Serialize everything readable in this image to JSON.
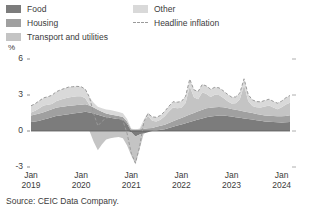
{
  "legend": {
    "left_items": [
      {
        "label": "Food",
        "color": "#7c7c7c",
        "marker": "swatch"
      },
      {
        "label": "Housing",
        "color": "#a0a0a0",
        "marker": "swatch"
      },
      {
        "label": "Transport and utilities",
        "color": "#c4c4c4",
        "marker": "swatch"
      }
    ],
    "right_items": [
      {
        "label": "Other",
        "color": "#d9d9d9",
        "marker": "swatch"
      },
      {
        "label": "Headline inflation",
        "color": "#9a9a9a",
        "marker": "dashed-line"
      }
    ]
  },
  "source": "Source: CEIC Data Company.",
  "chart_data": {
    "type": "area",
    "stacked": true,
    "title": "",
    "subtitle": "",
    "xlabel": "",
    "ylabel": "",
    "unit_label": "%",
    "grid": false,
    "legend_position": "top",
    "ylim": [
      -3,
      6
    ],
    "yticks": [
      6,
      3,
      0,
      -3
    ],
    "ytick_labels": [
      "6",
      "3",
      "0",
      "-3"
    ],
    "xlim": [
      "2019-01",
      "2024-04"
    ],
    "xticks": [
      "2019-01",
      "2020-01",
      "2021-01",
      "2022-01",
      "2023-01",
      "2024-01"
    ],
    "xtick_labels": [
      {
        "month": "Jan",
        "year": "2019"
      },
      {
        "month": "Jan",
        "year": "2020"
      },
      {
        "month": "Jan",
        "year": "2021"
      },
      {
        "month": "Jan",
        "year": "2022"
      },
      {
        "month": "Jan",
        "year": "2023"
      },
      {
        "month": "Jan",
        "year": "2024"
      }
    ],
    "x": [
      "2019-01",
      "2019-02",
      "2019-03",
      "2019-04",
      "2019-05",
      "2019-06",
      "2019-07",
      "2019-08",
      "2019-09",
      "2019-10",
      "2019-11",
      "2019-12",
      "2020-01",
      "2020-02",
      "2020-03",
      "2020-04",
      "2020-05",
      "2020-06",
      "2020-07",
      "2020-08",
      "2020-09",
      "2020-10",
      "2020-11",
      "2020-12",
      "2021-01",
      "2021-02",
      "2021-03",
      "2021-04",
      "2021-05",
      "2021-06",
      "2021-07",
      "2021-08",
      "2021-09",
      "2021-10",
      "2021-11",
      "2021-12",
      "2022-01",
      "2022-02",
      "2022-03",
      "2022-04",
      "2022-05",
      "2022-06",
      "2022-07",
      "2022-08",
      "2022-09",
      "2022-10",
      "2022-11",
      "2022-12",
      "2023-01",
      "2023-02",
      "2023-03",
      "2023-04",
      "2023-05",
      "2023-06",
      "2023-07",
      "2023-08",
      "2023-09",
      "2023-10",
      "2023-11",
      "2023-12",
      "2024-01",
      "2024-02",
      "2024-03"
    ],
    "series": [
      {
        "name": "Food",
        "color": "#7c7c7c",
        "values": [
          0.75,
          0.8,
          0.85,
          0.95,
          1.05,
          1.15,
          1.25,
          1.3,
          1.35,
          1.4,
          1.45,
          1.5,
          1.55,
          1.6,
          1.55,
          1.45,
          1.35,
          1.25,
          1.15,
          1.1,
          1.05,
          1.0,
          0.95,
          0.6,
          -0.1,
          -0.45,
          -0.3,
          -0.2,
          -0.1,
          0.0,
          0.05,
          0.1,
          0.15,
          0.25,
          0.35,
          0.45,
          0.55,
          0.65,
          0.75,
          0.85,
          0.95,
          1.05,
          1.15,
          1.2,
          1.25,
          1.3,
          1.3,
          1.25,
          1.2,
          1.15,
          1.1,
          1.05,
          1.0,
          0.95,
          0.9,
          0.85,
          0.8,
          0.78,
          0.75,
          0.72,
          0.7,
          0.72,
          0.75
        ]
      },
      {
        "name": "Housing",
        "color": "#a0a0a0",
        "values": [
          0.55,
          0.58,
          0.6,
          0.62,
          0.64,
          0.66,
          0.68,
          0.7,
          0.7,
          0.7,
          0.68,
          0.66,
          0.64,
          0.62,
          0.58,
          0.5,
          0.42,
          0.35,
          0.3,
          0.28,
          0.26,
          0.24,
          0.22,
          0.2,
          0.15,
          0.12,
          0.15,
          0.18,
          0.22,
          0.26,
          0.3,
          0.34,
          0.38,
          0.42,
          0.46,
          0.5,
          0.54,
          0.58,
          0.62,
          0.66,
          0.7,
          0.72,
          0.74,
          0.74,
          0.72,
          0.7,
          0.68,
          0.66,
          0.64,
          0.62,
          0.6,
          0.58,
          0.56,
          0.54,
          0.52,
          0.5,
          0.5,
          0.5,
          0.5,
          0.5,
          0.52,
          0.54,
          0.56
        ]
      },
      {
        "name": "Transport and utilities",
        "color": "#c4c4c4",
        "values": [
          0.25,
          0.3,
          0.45,
          0.55,
          0.5,
          0.45,
          0.55,
          0.6,
          0.65,
          0.7,
          0.72,
          0.74,
          0.7,
          0.5,
          0.05,
          -0.9,
          -1.6,
          -1.1,
          -0.7,
          -0.6,
          -0.55,
          -0.5,
          -0.6,
          -1.2,
          -1.95,
          -2.3,
          -1.2,
          0.55,
          1.05,
          0.6,
          0.45,
          0.5,
          0.7,
          0.95,
          1.15,
          0.95,
          0.85,
          1.1,
          2.35,
          1.3,
          1.0,
          1.45,
          1.2,
          0.9,
          1.05,
          1.0,
          0.8,
          0.6,
          0.45,
          0.55,
          0.95,
          2.2,
          0.95,
          0.6,
          0.55,
          0.6,
          0.75,
          0.85,
          0.7,
          0.6,
          0.75,
          0.95,
          1.05
        ]
      },
      {
        "name": "Other",
        "color": "#d9d9d9",
        "values": [
          0.55,
          0.6,
          0.62,
          0.64,
          0.66,
          0.72,
          0.78,
          0.82,
          0.84,
          0.86,
          0.84,
          0.82,
          0.8,
          0.76,
          0.64,
          0.4,
          0.26,
          0.3,
          0.34,
          0.36,
          0.36,
          0.34,
          0.3,
          0.2,
          0.05,
          -0.05,
          0.05,
          0.2,
          0.28,
          0.32,
          0.34,
          0.36,
          0.4,
          0.44,
          0.48,
          0.5,
          0.52,
          0.56,
          0.6,
          0.62,
          0.64,
          0.66,
          0.66,
          0.64,
          0.62,
          0.6,
          0.58,
          0.56,
          0.54,
          0.52,
          0.52,
          0.52,
          0.52,
          0.5,
          0.48,
          0.48,
          0.5,
          0.52,
          0.52,
          0.5,
          0.52,
          0.56,
          0.6
        ]
      }
    ],
    "overlay_line": {
      "name": "Headline inflation",
      "color": "#9a9a9a",
      "style": "dashed",
      "values": [
        2.1,
        2.28,
        2.52,
        2.76,
        2.85,
        2.98,
        3.26,
        3.42,
        3.54,
        3.66,
        3.69,
        3.72,
        3.69,
        3.48,
        2.82,
        1.45,
        0.43,
        0.8,
        1.09,
        1.14,
        1.12,
        1.08,
        0.87,
        -0.2,
        -1.85,
        -2.68,
        -1.3,
        0.73,
        1.45,
        1.18,
        1.14,
        1.3,
        1.63,
        2.06,
        2.44,
        2.4,
        2.46,
        2.89,
        4.32,
        3.43,
        3.29,
        3.88,
        3.75,
        3.48,
        3.64,
        3.6,
        3.36,
        3.07,
        2.83,
        2.84,
        3.17,
        4.35,
        3.03,
        2.59,
        2.45,
        2.43,
        2.55,
        2.65,
        2.47,
        2.32,
        2.49,
        2.77,
        2.96
      ]
    }
  }
}
